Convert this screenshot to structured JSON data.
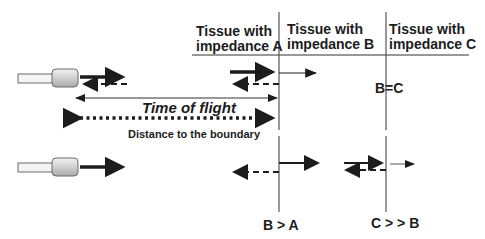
{
  "diagram": {
    "headers": [
      {
        "line1": "Tissue with",
        "line2": "impedance A"
      },
      {
        "line1": "Tissue with",
        "line2": "impedance B"
      },
      {
        "line1": "Tissue with",
        "line2": "impedance C"
      }
    ],
    "labels": {
      "time_of_flight": "Time of flight",
      "distance": "Distance to the boundary",
      "b_equals_c": "B=C",
      "b_greater_a": "B > A",
      "c_much_greater_b": "C > > B"
    },
    "colors": {
      "ink": "#1c1c1c",
      "line": "#555555",
      "transducer_body": "#d9d9d9",
      "transducer_stroke": "#6b6b6b"
    }
  }
}
